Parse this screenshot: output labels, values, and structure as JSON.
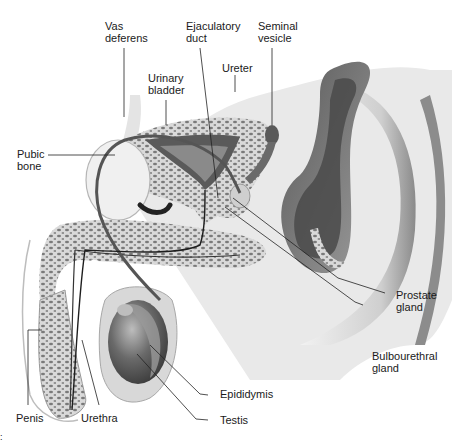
{
  "figure": {
    "colors": {
      "background": "#ffffff",
      "tissue_light": "#e6e6e6",
      "tissue_mid": "#bdbdbd",
      "tissue_dark": "#6e6e6e",
      "lumen_dark": "#3c3c3c",
      "leader_line": "#222222",
      "text": "#1a1a1a"
    }
  },
  "labels": {
    "vas_deferens": "Vas\ndeferens",
    "ejaculatory_duct": "Ejaculatory\nduct",
    "seminal_vesicle": "Seminal\nvesicle",
    "urinary_bladder": "Urinary\nbladder",
    "ureter": "Ureter",
    "pubic_bone": "Pubic\nbone",
    "prostate_gland": "Prostate\ngland",
    "bulbourethral_gland": "Bulbourethral\ngland",
    "epididymis": "Epididymis",
    "testis": "Testis",
    "penis": "Penis",
    "urethra": "Urethra"
  },
  "corner_mark": ":"
}
